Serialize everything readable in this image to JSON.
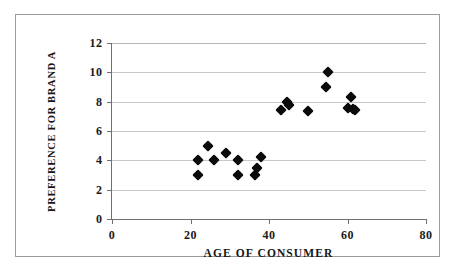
{
  "chart_data": {
    "type": "scatter",
    "title": "",
    "subtitle": "",
    "xlabel": "AGE OF CONSUMER",
    "ylabel": "PREFERENCE FOR BRAND A",
    "xlim": [
      0,
      80
    ],
    "ylim": [
      0,
      12
    ],
    "xticks": [
      0,
      20,
      40,
      60,
      80
    ],
    "yticks": [
      0,
      2,
      4,
      6,
      8,
      10,
      12
    ],
    "xtick_labels": [
      "0",
      "20",
      "40",
      "60",
      "80"
    ],
    "ytick_labels": [
      "0",
      "2",
      "4",
      "6",
      "8",
      "10",
      "12"
    ],
    "grid": "horizontal",
    "legend": "none",
    "marker": "filled-black-diamond",
    "marker_color": "#0a0a0a",
    "series": [
      {
        "name": "Consumers",
        "points": [
          [
            22,
            4.0
          ],
          [
            22,
            3.0
          ],
          [
            24.5,
            5.0
          ],
          [
            26,
            4.0
          ],
          [
            29,
            4.5
          ],
          [
            32,
            4.0
          ],
          [
            32,
            3.0
          ],
          [
            36.5,
            3.0
          ],
          [
            37,
            3.5
          ],
          [
            38,
            4.2
          ],
          [
            43,
            7.4
          ],
          [
            44.5,
            8.0
          ],
          [
            45,
            7.8
          ],
          [
            50,
            7.35
          ],
          [
            54.5,
            9.0
          ],
          [
            55,
            10.0
          ],
          [
            60,
            7.6
          ],
          [
            61,
            8.3
          ],
          [
            61.5,
            7.5
          ],
          [
            62,
            7.45
          ]
        ]
      }
    ]
  },
  "colors": {
    "marker": "#0a0a0a",
    "gridline": "#c8c8c8",
    "axis": "#6f6f6f",
    "frame": "#9a9a9a",
    "background": "#ffffff",
    "text": "#161616"
  }
}
